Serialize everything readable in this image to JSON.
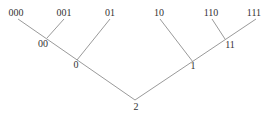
{
  "diagram": {
    "type": "binary-tree",
    "root": "2",
    "nodes": [
      {
        "id": "000",
        "label": "000",
        "x": 16,
        "y": 16,
        "anchor": "middle"
      },
      {
        "id": "001",
        "label": "001",
        "x": 64,
        "y": 16,
        "anchor": "middle"
      },
      {
        "id": "01",
        "label": "01",
        "x": 110,
        "y": 16,
        "anchor": "middle"
      },
      {
        "id": "10",
        "label": "10",
        "x": 159,
        "y": 16,
        "anchor": "middle"
      },
      {
        "id": "110",
        "label": "110",
        "x": 211,
        "y": 16,
        "anchor": "middle"
      },
      {
        "id": "111",
        "label": "111",
        "x": 254,
        "y": 16,
        "anchor": "middle"
      },
      {
        "id": "00",
        "label": "00",
        "x": 43,
        "y": 47,
        "anchor": "middle"
      },
      {
        "id": "11",
        "label": "11",
        "x": 230,
        "y": 48,
        "anchor": "middle"
      },
      {
        "id": "0",
        "label": "0",
        "x": 76,
        "y": 68,
        "anchor": "middle"
      },
      {
        "id": "1",
        "label": "1",
        "x": 193,
        "y": 69,
        "anchor": "middle"
      },
      {
        "id": "2",
        "label": "2",
        "x": 136,
        "y": 110,
        "anchor": "middle"
      }
    ],
    "edges": [
      {
        "from": "000",
        "to": "2",
        "x1": 18,
        "y1": 19,
        "x2": 135,
        "y2": 100
      },
      {
        "from": "001",
        "to": "00",
        "x1": 64,
        "y1": 19,
        "x2": 47,
        "y2": 38
      },
      {
        "from": "01",
        "to": "0",
        "x1": 110,
        "y1": 19,
        "x2": 77,
        "y2": 60
      },
      {
        "from": "111",
        "to": "2",
        "x1": 256,
        "y1": 19,
        "x2": 135,
        "y2": 100
      },
      {
        "from": "110",
        "to": "11",
        "x1": 212,
        "y1": 19,
        "x2": 225,
        "y2": 39
      },
      {
        "from": "10",
        "to": "1",
        "x1": 160,
        "y1": 19,
        "x2": 193,
        "y2": 62
      }
    ],
    "colors": {
      "edge": "#9a9a9a",
      "text": "#333333",
      "background": "#ffffff"
    }
  }
}
